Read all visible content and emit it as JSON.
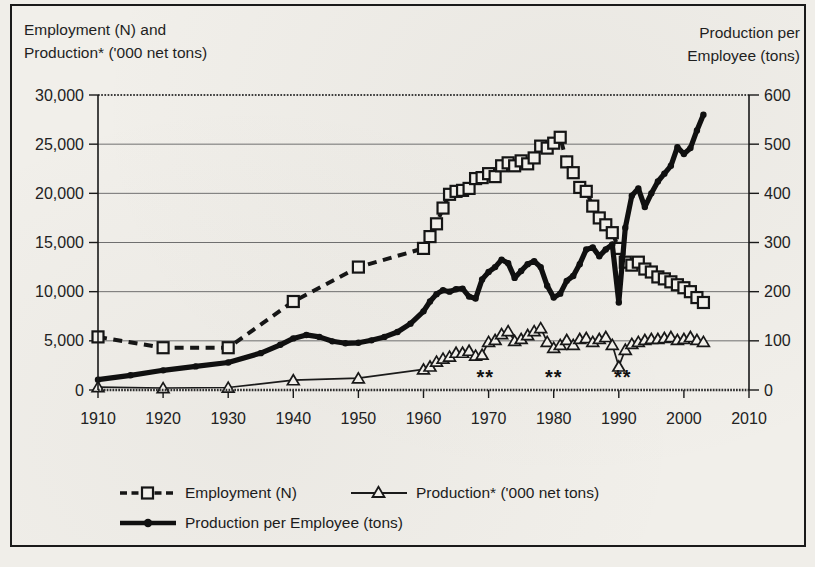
{
  "chart_data": {
    "type": "line",
    "title_left": [
      "Employment (N) and",
      "Production* ('000 net tons)"
    ],
    "title_right": [
      "Production per",
      "Employee (tons)"
    ],
    "x_axis": {
      "min": 1910,
      "max": 2010,
      "tick_interval": 10,
      "tick_labels": [
        "1910",
        "1920",
        "1930",
        "1940",
        "1950",
        "1960",
        "1970",
        "1980",
        "1990",
        "2000",
        "2010"
      ]
    },
    "left_axis": {
      "label": "Employment (N) and Production* ('000 net tons)",
      "min": 0,
      "max": 30000,
      "tick_interval": 5000,
      "tick_labels": [
        "0",
        "5,000",
        "10,000",
        "15,000",
        "20,000",
        "25,000",
        "30,000"
      ]
    },
    "right_axis": {
      "label": "Production per Employee (tons)",
      "min": 0,
      "max": 600,
      "tick_interval": 100,
      "tick_labels": [
        "0",
        "100",
        "200",
        "300",
        "400",
        "500",
        "600"
      ]
    },
    "grid": "horizontal",
    "legend_position": "bottom",
    "annotations": [
      {
        "text": "**",
        "year": 1969.5
      },
      {
        "text": "**",
        "year": 1980.0
      },
      {
        "text": "**",
        "year": 1990.6
      }
    ],
    "series": [
      {
        "name": "Employment (N)",
        "axis": "left",
        "line": "dashed",
        "marker": "open-square",
        "color": "#161616",
        "points": [
          [
            1910,
            5400
          ],
          [
            1920,
            4300
          ],
          [
            1930,
            4300
          ],
          [
            1940,
            9000
          ],
          [
            1950,
            12500
          ],
          [
            1960,
            14400
          ],
          [
            1961,
            15600
          ],
          [
            1962,
            16900
          ],
          [
            1963,
            18500
          ],
          [
            1964,
            19900
          ],
          [
            1965,
            20200
          ],
          [
            1966,
            20300
          ],
          [
            1967,
            20500
          ],
          [
            1968,
            21500
          ],
          [
            1969,
            21600
          ],
          [
            1970,
            22000
          ],
          [
            1971,
            21700
          ],
          [
            1972,
            22800
          ],
          [
            1973,
            23100
          ],
          [
            1974,
            22800
          ],
          [
            1975,
            23300
          ],
          [
            1976,
            23000
          ],
          [
            1977,
            23600
          ],
          [
            1978,
            24800
          ],
          [
            1979,
            24600
          ],
          [
            1980,
            25100
          ],
          [
            1981,
            25700
          ],
          [
            1982,
            23200
          ],
          [
            1983,
            22100
          ],
          [
            1984,
            20600
          ],
          [
            1985,
            20200
          ],
          [
            1986,
            18700
          ],
          [
            1987,
            17500
          ],
          [
            1988,
            16800
          ],
          [
            1989,
            16000
          ],
          [
            1990,
            14400
          ],
          [
            1991,
            13000
          ],
          [
            1992,
            12700
          ],
          [
            1993,
            13000
          ],
          [
            1994,
            12300
          ],
          [
            1995,
            12000
          ],
          [
            1996,
            11500
          ],
          [
            1997,
            11300
          ],
          [
            1998,
            11000
          ],
          [
            1999,
            10700
          ],
          [
            2000,
            10400
          ],
          [
            2001,
            10000
          ],
          [
            2002,
            9400
          ],
          [
            2003,
            8900
          ]
        ]
      },
      {
        "name": "Production* ('000 net tons)",
        "axis": "left",
        "line": "thin-solid",
        "marker": "open-triangle",
        "color": "#1b1b1b",
        "points": [
          [
            1910,
            300
          ],
          [
            1920,
            200
          ],
          [
            1930,
            250
          ],
          [
            1940,
            1000
          ],
          [
            1950,
            1200
          ],
          [
            1960,
            2100
          ],
          [
            1961,
            2400
          ],
          [
            1962,
            2900
          ],
          [
            1963,
            3200
          ],
          [
            1964,
            3400
          ],
          [
            1965,
            3800
          ],
          [
            1966,
            3800
          ],
          [
            1967,
            4000
          ],
          [
            1968,
            3500
          ],
          [
            1969,
            3600
          ],
          [
            1970,
            4900
          ],
          [
            1971,
            5100
          ],
          [
            1972,
            5700
          ],
          [
            1973,
            6000
          ],
          [
            1974,
            5000
          ],
          [
            1975,
            5200
          ],
          [
            1976,
            5600
          ],
          [
            1977,
            6000
          ],
          [
            1978,
            6300
          ],
          [
            1979,
            4900
          ],
          [
            1980,
            4300
          ],
          [
            1981,
            4600
          ],
          [
            1982,
            5100
          ],
          [
            1983,
            4600
          ],
          [
            1984,
            5200
          ],
          [
            1985,
            5300
          ],
          [
            1986,
            4900
          ],
          [
            1987,
            5200
          ],
          [
            1988,
            5400
          ],
          [
            1989,
            4600
          ],
          [
            1990,
            2400
          ],
          [
            1991,
            4100
          ],
          [
            1992,
            4700
          ],
          [
            1993,
            4900
          ],
          [
            1994,
            5100
          ],
          [
            1995,
            5200
          ],
          [
            1996,
            5200
          ],
          [
            1997,
            5300
          ],
          [
            1998,
            5400
          ],
          [
            1999,
            5100
          ],
          [
            2000,
            5200
          ],
          [
            2001,
            5400
          ],
          [
            2002,
            5100
          ],
          [
            2003,
            4900
          ]
        ]
      },
      {
        "name": "Production per Employee (tons)",
        "axis": "right",
        "line": "thick-solid",
        "marker": "filled-circle",
        "color": "#101010",
        "points": [
          [
            1910,
            21
          ],
          [
            1915,
            30
          ],
          [
            1920,
            40
          ],
          [
            1925,
            48
          ],
          [
            1930,
            56
          ],
          [
            1935,
            75
          ],
          [
            1938,
            92
          ],
          [
            1940,
            105
          ],
          [
            1942,
            112
          ],
          [
            1944,
            108
          ],
          [
            1946,
            99
          ],
          [
            1948,
            95
          ],
          [
            1950,
            96
          ],
          [
            1952,
            101
          ],
          [
            1954,
            108
          ],
          [
            1956,
            118
          ],
          [
            1958,
            135
          ],
          [
            1960,
            160
          ],
          [
            1961,
            180
          ],
          [
            1962,
            195
          ],
          [
            1963,
            203
          ],
          [
            1964,
            200
          ],
          [
            1965,
            205
          ],
          [
            1966,
            206
          ],
          [
            1967,
            190
          ],
          [
            1968,
            186
          ],
          [
            1969,
            225
          ],
          [
            1970,
            240
          ],
          [
            1971,
            250
          ],
          [
            1972,
            265
          ],
          [
            1973,
            258
          ],
          [
            1974,
            228
          ],
          [
            1975,
            242
          ],
          [
            1976,
            256
          ],
          [
            1977,
            262
          ],
          [
            1978,
            250
          ],
          [
            1979,
            212
          ],
          [
            1980,
            188
          ],
          [
            1981,
            196
          ],
          [
            1982,
            222
          ],
          [
            1983,
            232
          ],
          [
            1984,
            256
          ],
          [
            1985,
            286
          ],
          [
            1986,
            290
          ],
          [
            1987,
            272
          ],
          [
            1988,
            286
          ],
          [
            1989,
            296
          ],
          [
            1990,
            178
          ],
          [
            1991,
            330
          ],
          [
            1992,
            395
          ],
          [
            1993,
            410
          ],
          [
            1994,
            372
          ],
          [
            1995,
            400
          ],
          [
            1996,
            424
          ],
          [
            1997,
            440
          ],
          [
            1998,
            456
          ],
          [
            1999,
            494
          ],
          [
            2000,
            480
          ],
          [
            2001,
            492
          ],
          [
            2002,
            528
          ],
          [
            2003,
            560
          ]
        ]
      }
    ],
    "colors": {
      "ink": "#161616",
      "grid": "#6f6f6f",
      "paper": "#f1efea"
    }
  }
}
